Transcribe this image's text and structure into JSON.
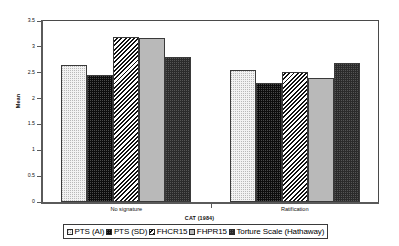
{
  "chart_data": {
    "type": "bar",
    "title": "",
    "xlabel": "CAT (1984)",
    "ylabel": "Mean",
    "categories": [
      "No signature",
      "Ratification"
    ],
    "ylim": [
      0,
      3.5
    ],
    "yticks": [
      "0",
      "0.5",
      "1",
      "1.5",
      "2",
      "2.5",
      "3",
      "3.5"
    ],
    "ytick_values": [
      0,
      0.5,
      1,
      1.5,
      2,
      2.5,
      3,
      3.5
    ],
    "grid": false,
    "legend_position": "bottom",
    "series": [
      {
        "name": "PTS (AI)",
        "pattern": "light-dotted",
        "values": [
          2.64,
          2.56
        ]
      },
      {
        "name": "PTS (SD)",
        "pattern": "dark-dotted",
        "values": [
          2.46,
          2.31
        ]
      },
      {
        "name": "FHCR15",
        "pattern": "diagonal-hatch",
        "values": [
          3.19,
          2.52
        ]
      },
      {
        "name": "FHPR15",
        "pattern": "solid-gray",
        "values": [
          3.17,
          2.39
        ]
      },
      {
        "name": "Torture Scale (Hathaway)",
        "pattern": "solid-black",
        "values": [
          2.8,
          2.68
        ]
      }
    ]
  },
  "legend": {
    "items": [
      {
        "label": "PTS (AI)"
      },
      {
        "label": "PTS (SD)"
      },
      {
        "label": "FHCR15"
      },
      {
        "label": "FHPR15"
      },
      {
        "label": "Torture Scale (Hathaway)"
      }
    ]
  }
}
